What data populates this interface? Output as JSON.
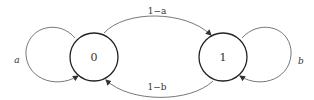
{
  "diagram": {
    "type": "markov-chain",
    "states": [
      {
        "id": "s0",
        "label": "0"
      },
      {
        "id": "s1",
        "label": "1"
      }
    ],
    "transitions": [
      {
        "from": "0",
        "to": "0",
        "label": "a"
      },
      {
        "from": "0",
        "to": "1",
        "label": "1−a"
      },
      {
        "from": "1",
        "to": "0",
        "label": "1−b"
      },
      {
        "from": "1",
        "to": "1",
        "label": "b"
      }
    ],
    "colors": {
      "stroke": "#333333",
      "background": "#ffffff"
    }
  }
}
